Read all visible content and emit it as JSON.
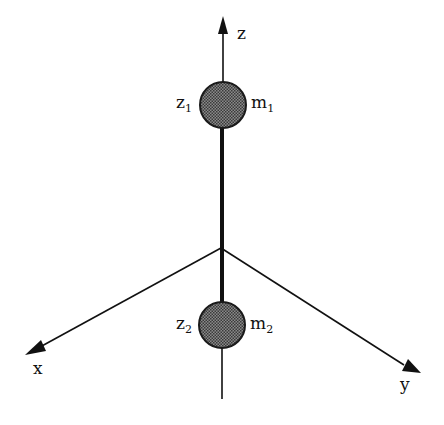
{
  "diagram": {
    "type": "3d-coordinate-axes-two-mass-system",
    "colors": {
      "line": "#111111",
      "sphere_fill": "#6a6a6a",
      "sphere_stroke": "#1a1a1a",
      "background": "#ffffff"
    },
    "axes": {
      "z": {
        "label": "z"
      },
      "x": {
        "label": "x"
      },
      "y": {
        "label": "y"
      }
    },
    "masses": [
      {
        "position_label": "z",
        "position_sub": "1",
        "mass_label": "m",
        "mass_sub": "1"
      },
      {
        "position_label": "z",
        "position_sub": "2",
        "mass_label": "m",
        "mass_sub": "2"
      }
    ]
  }
}
